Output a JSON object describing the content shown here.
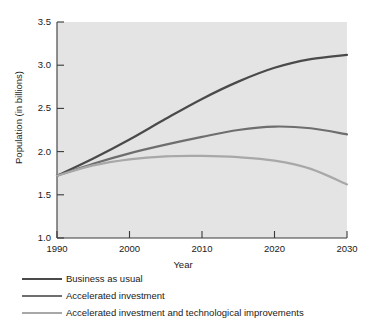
{
  "chart_data": {
    "type": "line",
    "title": "",
    "xlabel": "Year",
    "ylabel": "Population (in billions)",
    "xlim": [
      1990,
      2030
    ],
    "ylim": [
      1.0,
      3.5
    ],
    "xticks": [
      1990,
      2000,
      2010,
      2020,
      2030
    ],
    "xtick_labels": [
      "1990",
      "2000",
      "2010",
      "2020",
      "2030"
    ],
    "yticks": [
      1.0,
      1.5,
      2.0,
      2.5,
      3.0,
      3.5
    ],
    "ytick_labels": [
      "1.0",
      "1.5",
      "2.0",
      "2.5",
      "3.0",
      "3.5"
    ],
    "grid": false,
    "legend_position": "below-axes-left",
    "plot_background": "#e4e4e4",
    "x": [
      1990,
      1995,
      2000,
      2005,
      2010,
      2015,
      2020,
      2025,
      2030
    ],
    "series": [
      {
        "name": "Business as usual",
        "color": "#4a4a4a",
        "values": [
          1.72,
          1.92,
          2.14,
          2.38,
          2.61,
          2.81,
          2.97,
          3.07,
          3.12
        ]
      },
      {
        "name": "Accelerated investment",
        "color": "#6e6e6e",
        "values": [
          1.72,
          1.86,
          1.98,
          2.08,
          2.17,
          2.25,
          2.29,
          2.27,
          2.2
        ]
      },
      {
        "name": "Accelerated investment and technological improvements",
        "color": "#a8a8a8",
        "values": [
          1.72,
          1.84,
          1.91,
          1.945,
          1.95,
          1.935,
          1.895,
          1.8,
          1.62
        ]
      }
    ]
  }
}
